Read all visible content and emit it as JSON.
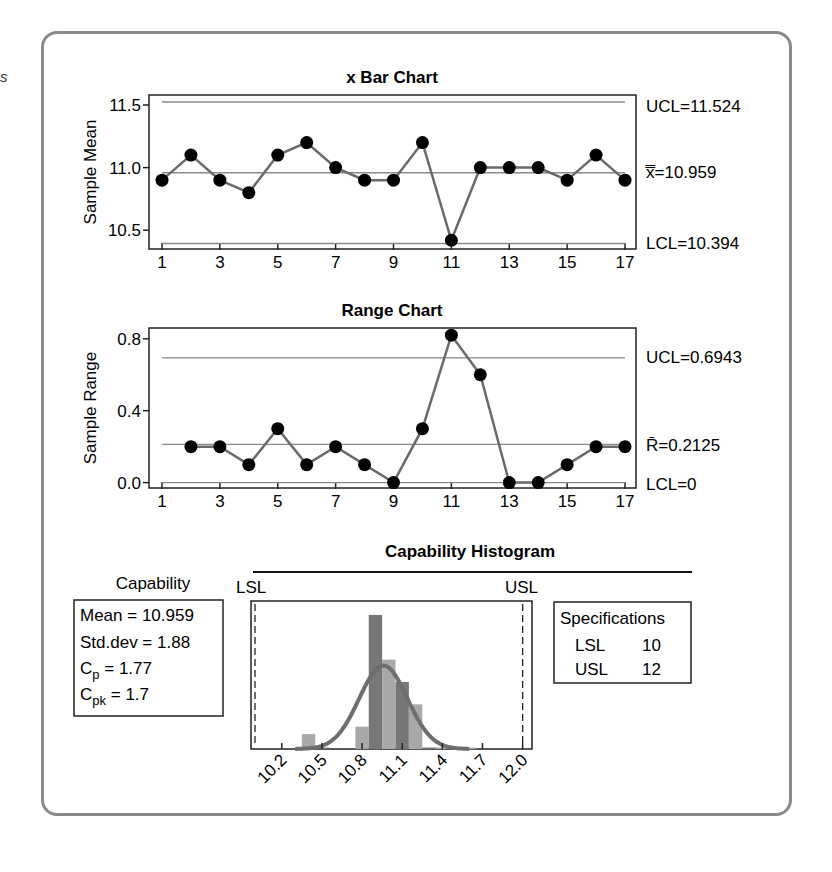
{
  "stray_glyph": "s",
  "chart_data": [
    {
      "type": "line",
      "title": "x Bar Chart",
      "xlabel": "",
      "ylabel": "Sample Mean",
      "x": [
        1,
        2,
        3,
        4,
        5,
        6,
        7,
        8,
        9,
        10,
        11,
        12,
        13,
        14,
        15,
        16,
        17
      ],
      "x_ticks": [
        "1",
        "3",
        "5",
        "7",
        "9",
        "11",
        "13",
        "15",
        "17"
      ],
      "y_ticks": [
        "10.5",
        "11.0",
        "11.5"
      ],
      "ylim": [
        10.35,
        11.58
      ],
      "values": [
        10.9,
        11.1,
        10.9,
        10.8,
        11.1,
        11.2,
        11.0,
        10.9,
        10.9,
        11.2,
        10.42,
        11.0,
        11.0,
        11.0,
        10.9,
        11.1,
        10.9
      ],
      "control_lines": {
        "UCL": 11.524,
        "CL": 10.959,
        "LCL": 10.394
      },
      "labels": {
        "UCL": "UCL=11.524",
        "CL": "x̿=10.959",
        "LCL": "LCL=10.394"
      },
      "grid": false
    },
    {
      "type": "line",
      "title": "Range Chart",
      "xlabel": "",
      "ylabel": "Sample Range",
      "x": [
        2,
        3,
        4,
        5,
        6,
        7,
        8,
        9,
        10,
        11,
        12,
        13,
        14,
        15,
        16,
        17
      ],
      "x_ticks": [
        "1",
        "3",
        "5",
        "7",
        "9",
        "11",
        "13",
        "15",
        "17"
      ],
      "y_ticks": [
        "0.0",
        "0.4",
        "0.8"
      ],
      "ylim": [
        -0.03,
        0.86
      ],
      "values": [
        0.2,
        0.2,
        0.1,
        0.3,
        0.1,
        0.2,
        0.1,
        0.0,
        0.3,
        0.82,
        0.6,
        0.0,
        0.0,
        0.1,
        0.2,
        0.2
      ],
      "control_lines": {
        "UCL": 0.6943,
        "CL": 0.2125,
        "LCL": 0
      },
      "labels": {
        "UCL": "UCL=0.6943",
        "CL": "R̄=0.2125",
        "LCL": "LCL=0"
      },
      "grid": false
    },
    {
      "type": "bar",
      "title": "Capability Histogram",
      "x_ticks": [
        "10.2",
        "10.5",
        "10.8",
        "11.1",
        "11.4",
        "11.7",
        "12.0"
      ],
      "bins": [
        {
          "from": 10.35,
          "to": 10.45,
          "height": 1
        },
        {
          "from": 10.45,
          "to": 10.55,
          "height": 0.1
        },
        {
          "from": 10.75,
          "to": 10.85,
          "height": 1.5
        },
        {
          "from": 10.85,
          "to": 10.95,
          "height": 9
        },
        {
          "from": 10.95,
          "to": 11.05,
          "height": 6
        },
        {
          "from": 11.05,
          "to": 11.15,
          "height": 4.5
        },
        {
          "from": 11.15,
          "to": 11.25,
          "height": 3
        },
        {
          "from": 11.25,
          "to": 11.35,
          "height": 0.1
        },
        {
          "from": 11.35,
          "to": 11.45,
          "height": 0.1
        },
        {
          "from": 11.45,
          "to": 11.55,
          "height": 0.1
        },
        {
          "from": 11.55,
          "to": 11.65,
          "height": 0.1
        }
      ],
      "spec_lines": {
        "LSL": 10,
        "USL": 12
      },
      "normal_curve": {
        "mean": 10.959,
        "peak": 5.6
      },
      "xlim": [
        9.97,
        12.07
      ]
    }
  ],
  "capability": {
    "heading": "Capability",
    "mean": "Mean = 10.959",
    "std": "Std.dev = 1.88",
    "cp_label": "C",
    "cp_sub": "p",
    "cp_value": " = 1.77",
    "cpk_label": "C",
    "cpk_sub": "pk",
    "cpk_value": " = 1.7"
  },
  "specifications": {
    "heading": "Specifications",
    "rows": [
      {
        "name": "LSL",
        "value": "10"
      },
      {
        "name": "USL",
        "value": "12"
      }
    ]
  },
  "hist_labels": {
    "lsl": "LSL",
    "usl": "USL"
  }
}
